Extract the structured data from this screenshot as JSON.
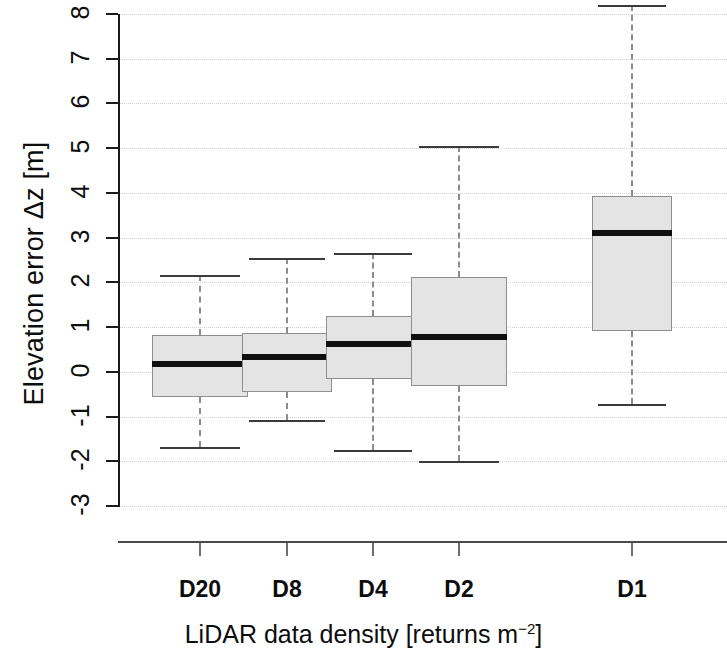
{
  "axes": {
    "ylabel": "Elevation error Δz [m]",
    "xlabel_main": "LiDAR data density [returns m",
    "xlabel_sup": "−2",
    "xlabel_tail": "]",
    "y_ticks": [
      "8",
      "7",
      "6",
      "5",
      "4",
      "3",
      "2",
      "1",
      "0",
      "-1",
      "-2",
      "-3"
    ],
    "x_ticks": [
      "D20",
      "D8",
      "D4",
      "D2",
      "D1"
    ]
  },
  "chart_data": {
    "type": "box",
    "title": "",
    "xlabel": "LiDAR data density [returns m^-2]",
    "ylabel": "Elevation error Δz [m]",
    "ylim": [
      -3.2,
      8.4
    ],
    "categories": [
      "D20",
      "D8",
      "D4",
      "D2",
      "D1"
    ],
    "grid": true,
    "legend": "none",
    "box_fill": "#e4e4e4",
    "box_border": "#8e8e8e",
    "median_color": "#101010",
    "whisker_color": "#8c8c8c",
    "boxes": [
      {
        "label": "D20",
        "whisker_low": -1.68,
        "q1": -0.57,
        "median": 0.18,
        "q3": 0.83,
        "whisker_high": 2.16
      },
      {
        "label": "D8",
        "whisker_low": -1.08,
        "q1": -0.45,
        "median": 0.34,
        "q3": 0.86,
        "whisker_high": 2.55
      },
      {
        "label": "D4",
        "whisker_low": -1.75,
        "q1": -0.16,
        "median": 0.63,
        "q3": 1.25,
        "whisker_high": 2.66
      },
      {
        "label": "D2",
        "whisker_low": -1.99,
        "q1": -0.32,
        "median": 0.78,
        "q3": 2.13,
        "whisker_high": 5.04
      },
      {
        "label": "D1",
        "whisker_low": -0.72,
        "q1": 0.92,
        "median": 3.1,
        "q3": 3.93,
        "whisker_high": 8.2
      }
    ]
  },
  "geometry": {
    "y_top_value": 8,
    "y_top_px": 14,
    "y_bot_value": -3,
    "y_bot_px": 506,
    "x_centers_px": [
      200,
      287,
      373,
      459,
      632
    ],
    "box_widths_px": [
      96,
      90,
      94,
      96,
      80
    ]
  }
}
